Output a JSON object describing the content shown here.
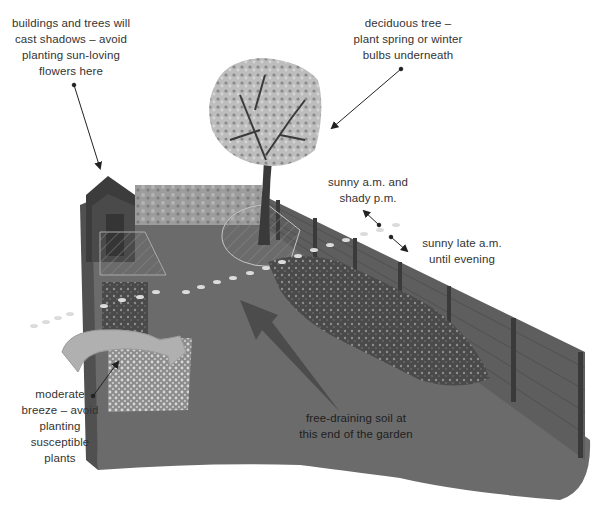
{
  "diagram": {
    "colors": {
      "background": "#ffffff",
      "ground": "#6b6b6b",
      "ground_dark": "#575757",
      "fence": "#5e5e5e",
      "fence_post": "#3a3a3a",
      "wall": "#9a9a9a",
      "shed": "#3c3c3c",
      "tree_canopy": "#b8b8b8",
      "tree_trunk": "#3a3a3a",
      "border_bed": "#4a4a4a",
      "breeze_arrow": "#b0b0b0",
      "drainage_arrow": "#4c4c4c",
      "label_text": "#333333",
      "leader_line": "#222222"
    },
    "annotations": [
      {
        "id": "shadows",
        "text": "buildings and trees will\ncast shadows – avoid\nplanting sun-loving\nflowers here",
        "points_to": "shed"
      },
      {
        "id": "deciduous-tree",
        "text": "deciduous tree –\nplant spring or winter\nbulbs underneath",
        "points_to": "tree"
      },
      {
        "id": "sunny-am",
        "text": "sunny a.m. and\nshady p.m.",
        "points_to": "back-left side"
      },
      {
        "id": "sunny-late-am",
        "text": "sunny late a.m.\nuntil evening",
        "points_to": "fence border"
      },
      {
        "id": "breeze",
        "text": "moderate\nbreeze – avoid\nplanting\nsusceptible\nplants",
        "points_to": "breeze arrow"
      },
      {
        "id": "drainage",
        "text": "free-draining soil at\nthis end of the garden",
        "points_to": "slope arrow"
      }
    ],
    "elements": [
      "shed",
      "stone wall",
      "deciduous tree",
      "paved patio",
      "fence",
      "planting border",
      "gravel bed",
      "stepping-stone path",
      "breeze arrow",
      "drainage arrow"
    ]
  }
}
